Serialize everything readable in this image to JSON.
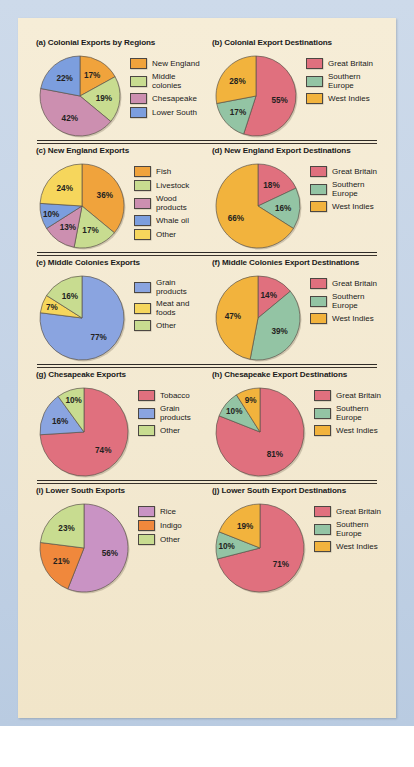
{
  "figure": {
    "background_color": "#f3e9d1",
    "surround_color": "#c9d7e8"
  },
  "palette": {
    "orange": "#f0a33c",
    "green": "#c8dc90",
    "pink": "#cc8fb0",
    "blue": "#7c9ede",
    "rose": "#e0707e",
    "sage": "#93c4a4",
    "amber": "#f2b33d",
    "yellow": "#f6d65c",
    "periwinkle": "#8aa4e0",
    "mauve": "#c993c4"
  },
  "charts": [
    {
      "id": "a",
      "title": "(a) Colonial Exports by Regions",
      "type": "pie",
      "labels": [
        "New England",
        "Middle colonies",
        "Chesapeake",
        "Lower South"
      ],
      "values": [
        17,
        19,
        42,
        22
      ],
      "value_labels": [
        "17%",
        "19%",
        "42%",
        "22%"
      ],
      "colors": [
        "#f0a33c",
        "#c8dc90",
        "#cc8fb0",
        "#7c9ede"
      ]
    },
    {
      "id": "b",
      "title": "(b) Colonial Export Destinations",
      "type": "pie",
      "labels": [
        "Great Britain",
        "Southern\nEurope",
        "West Indies"
      ],
      "values": [
        55,
        17,
        28
      ],
      "value_labels": [
        "55%",
        "17%",
        "28%"
      ],
      "colors": [
        "#e0707e",
        "#93c4a4",
        "#f2b33d"
      ]
    },
    {
      "id": "c",
      "title": "(c) New England Exports",
      "type": "pie",
      "labels": [
        "Fish",
        "Livestock",
        "Wood products",
        "Whale oil",
        "Other"
      ],
      "values": [
        36,
        17,
        13,
        10,
        24
      ],
      "value_labels": [
        "36%",
        "17%",
        "13%",
        "10%",
        "24%"
      ],
      "colors": [
        "#f0a33c",
        "#c8dc90",
        "#cc8fb0",
        "#7c9ede",
        "#f6d65c"
      ]
    },
    {
      "id": "d",
      "title": "(d) New England Export Destinations",
      "type": "pie",
      "labels": [
        "Great Britain",
        "Southern\nEurope",
        "West Indies"
      ],
      "values": [
        18,
        16,
        66
      ],
      "value_labels": [
        "18%",
        "16%",
        "66%"
      ],
      "colors": [
        "#e0707e",
        "#93c4a4",
        "#f2b33d"
      ]
    },
    {
      "id": "e",
      "title": "(e) Middle Colonies Exports",
      "type": "pie",
      "labels": [
        "Grain products",
        "Meat and foods",
        "Other"
      ],
      "values": [
        77,
        7,
        16
      ],
      "value_labels": [
        "77%",
        "7%",
        "16%"
      ],
      "colors": [
        "#8aa4e0",
        "#f6d65c",
        "#c8dc90"
      ]
    },
    {
      "id": "f",
      "title": "(f) Middle Colonies Export Destinations",
      "type": "pie",
      "labels": [
        "Great Britain",
        "Southern\nEurope",
        "West Indies"
      ],
      "values": [
        14,
        39,
        47
      ],
      "value_labels": [
        "14%",
        "39%",
        "47%"
      ],
      "colors": [
        "#e0707e",
        "#93c4a4",
        "#f2b33d"
      ]
    },
    {
      "id": "g",
      "title": "(g) Chesapeake Exports",
      "type": "pie",
      "labels": [
        "Tobacco",
        "Grain products",
        "Other"
      ],
      "values": [
        74,
        16,
        10
      ],
      "value_labels": [
        "74%",
        "16%",
        "10%"
      ],
      "colors": [
        "#e0707e",
        "#8aa4e0",
        "#c8dc90"
      ]
    },
    {
      "id": "h",
      "title": "(h) Chesapeake Export Destinations",
      "type": "pie",
      "labels": [
        "Great Britain",
        "Southern\nEurope",
        "West Indies"
      ],
      "values": [
        81,
        10,
        9
      ],
      "value_labels": [
        "81%",
        "10%",
        "9%"
      ],
      "colors": [
        "#e0707e",
        "#93c4a4",
        "#f2b33d"
      ]
    },
    {
      "id": "i",
      "title": "(i) Lower South Exports",
      "type": "pie",
      "labels": [
        "Rice",
        "Indigo",
        "Other"
      ],
      "values": [
        56,
        21,
        23
      ],
      "value_labels": [
        "56%",
        "21%",
        "23%"
      ],
      "colors": [
        "#c993c4",
        "#f0883c",
        "#c8dc90"
      ]
    },
    {
      "id": "j",
      "title": "(j) Lower South Export Destinations",
      "type": "pie",
      "labels": [
        "Great Britain",
        "Southern\nEurope",
        "West Indies"
      ],
      "values": [
        71,
        10,
        19
      ],
      "value_labels": [
        "71%",
        "10%",
        "19%"
      ],
      "colors": [
        "#e0707e",
        "#93c4a4",
        "#f2b33d"
      ]
    }
  ],
  "chart_data": [
    {
      "type": "pie",
      "title": "(a) Colonial Exports by Regions",
      "categories": [
        "New England",
        "Middle colonies",
        "Chesapeake",
        "Lower South"
      ],
      "values": [
        17,
        19,
        42,
        22
      ],
      "units": "percent",
      "legend": "right"
    },
    {
      "type": "pie",
      "title": "(b) Colonial Export Destinations",
      "categories": [
        "Great Britain",
        "Southern Europe",
        "West Indies"
      ],
      "values": [
        55,
        17,
        28
      ],
      "units": "percent",
      "legend": "right"
    },
    {
      "type": "pie",
      "title": "(c) New England Exports",
      "categories": [
        "Fish",
        "Livestock",
        "Wood products",
        "Whale oil",
        "Other"
      ],
      "values": [
        36,
        17,
        13,
        10,
        24
      ],
      "units": "percent",
      "legend": "right"
    },
    {
      "type": "pie",
      "title": "(d) New England Export Destinations",
      "categories": [
        "Great Britain",
        "Southern Europe",
        "West Indies"
      ],
      "values": [
        18,
        16,
        66
      ],
      "units": "percent",
      "legend": "right"
    },
    {
      "type": "pie",
      "title": "(e) Middle Colonies Exports",
      "categories": [
        "Grain products",
        "Meat and foods",
        "Other"
      ],
      "values": [
        77,
        7,
        16
      ],
      "units": "percent",
      "legend": "right"
    },
    {
      "type": "pie",
      "title": "(f) Middle Colonies Export Destinations",
      "categories": [
        "Great Britain",
        "Southern Europe",
        "West Indies"
      ],
      "values": [
        14,
        39,
        47
      ],
      "units": "percent",
      "legend": "right"
    },
    {
      "type": "pie",
      "title": "(g) Chesapeake Exports",
      "categories": [
        "Tobacco",
        "Grain products",
        "Other"
      ],
      "values": [
        74,
        16,
        10
      ],
      "units": "percent",
      "legend": "right"
    },
    {
      "type": "pie",
      "title": "(h) Chesapeake Export Destinations",
      "categories": [
        "Great Britain",
        "Southern Europe",
        "West Indies"
      ],
      "values": [
        81,
        10,
        9
      ],
      "units": "percent",
      "legend": "right"
    },
    {
      "type": "pie",
      "title": "(i) Lower South Exports",
      "categories": [
        "Rice",
        "Indigo",
        "Other"
      ],
      "values": [
        56,
        21,
        23
      ],
      "units": "percent",
      "legend": "right"
    },
    {
      "type": "pie",
      "title": "(j) Lower South Export Destinations",
      "categories": [
        "Great Britain",
        "Southern Europe",
        "West Indies"
      ],
      "values": [
        71,
        10,
        19
      ],
      "units": "percent",
      "legend": "right"
    }
  ],
  "layout": {
    "rows": [
      {
        "charts": [
          "a",
          "b"
        ],
        "pie_radius": 40,
        "top": 20,
        "divider_after": true
      },
      {
        "charts": [
          "c",
          "d"
        ],
        "pie_radius": 42,
        "top": 0,
        "divider_after": true
      },
      {
        "charts": [
          "e",
          "f"
        ],
        "pie_radius": 42,
        "top": 0,
        "divider_after": true
      },
      {
        "charts": [
          "g",
          "h"
        ],
        "pie_radius": 44,
        "top": 0,
        "divider_after": true
      },
      {
        "charts": [
          "i",
          "j"
        ],
        "pie_radius": 44,
        "top": 0,
        "divider_after": false
      }
    ]
  }
}
